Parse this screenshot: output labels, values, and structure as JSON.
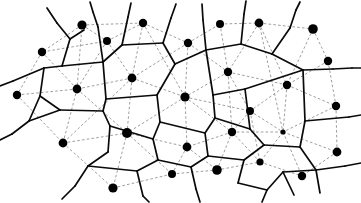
{
  "figure": {
    "width": 361,
    "height": 203,
    "background_color": "#ffffff"
  },
  "legend": {
    "site_label": "site point",
    "voronoi_label": "Voronoi edge",
    "delaunay_label": "Delaunay edge"
  },
  "style": {
    "voronoi_color": "#0a0a0a",
    "delaunay_color": "#8d8d8d",
    "site_color": "#000000",
    "voronoi_width": 1.7,
    "delaunay_width": 0.85,
    "delaunay_dash": "2.6 2.2"
  },
  "chart_data": {
    "type": "scatter",
    "xlabel": "",
    "ylabel": "",
    "xlim": [
      0,
      361
    ],
    "ylim": [
      0,
      203
    ],
    "grid": false,
    "legend_position": "none",
    "sites": [
      {
        "id": 0,
        "x": 82,
        "y": 25,
        "r": 4.6
      },
      {
        "id": 1,
        "x": 107,
        "y": 41,
        "r": 4.0
      },
      {
        "id": 2,
        "x": 143,
        "y": 23,
        "r": 4.2
      },
      {
        "id": 3,
        "x": 188,
        "y": 43,
        "r": 4.2
      },
      {
        "id": 4,
        "x": 220,
        "y": 24,
        "r": 4.0
      },
      {
        "id": 5,
        "x": 259,
        "y": 23,
        "r": 4.4
      },
      {
        "id": 6,
        "x": 313,
        "y": 29,
        "r": 4.8
      },
      {
        "id": 7,
        "x": 42,
        "y": 52,
        "r": 4.2
      },
      {
        "id": 8,
        "x": 132,
        "y": 78,
        "r": 4.4
      },
      {
        "id": 9,
        "x": 228,
        "y": 72,
        "r": 4.2
      },
      {
        "id": 10,
        "x": 328,
        "y": 61,
        "r": 4.2
      },
      {
        "id": 11,
        "x": 17,
        "y": 95,
        "r": 4.2
      },
      {
        "id": 12,
        "x": 77,
        "y": 89,
        "r": 4.4
      },
      {
        "id": 13,
        "x": 185,
        "y": 97,
        "r": 4.6
      },
      {
        "id": 14,
        "x": 287,
        "y": 85,
        "r": 4.2
      },
      {
        "id": 15,
        "x": 250,
        "y": 111,
        "r": 4.0
      },
      {
        "id": 16,
        "x": 336,
        "y": 106,
        "r": 4.2
      },
      {
        "id": 17,
        "x": 63,
        "y": 143,
        "r": 4.4
      },
      {
        "id": 18,
        "x": 127,
        "y": 133,
        "r": 5.0
      },
      {
        "id": 19,
        "x": 232,
        "y": 132,
        "r": 4.2
      },
      {
        "id": 20,
        "x": 283,
        "y": 132,
        "r": 2.6
      },
      {
        "id": 21,
        "x": 337,
        "y": 152,
        "r": 4.4
      },
      {
        "id": 22,
        "x": 187,
        "y": 147,
        "r": 4.4
      },
      {
        "id": 23,
        "x": 113,
        "y": 188,
        "r": 4.6
      },
      {
        "id": 24,
        "x": 172,
        "y": 174,
        "r": 4.0
      },
      {
        "id": 25,
        "x": 217,
        "y": 170,
        "r": 4.8
      },
      {
        "id": 26,
        "x": 260,
        "y": 162,
        "r": 3.6
      },
      {
        "id": 27,
        "x": 302,
        "y": 176,
        "r": 4.2
      }
    ],
    "voronoi_edges": [
      [
        [
          13,
          81
        ],
        [
          44,
          68
        ]
      ],
      [
        [
          44,
          68
        ],
        [
          62,
          66
        ]
      ],
      [
        [
          62,
          66
        ],
        [
          70,
          39
        ]
      ],
      [
        [
          70,
          39
        ],
        [
          57,
          23
        ]
      ],
      [
        [
          62,
          66
        ],
        [
          103,
          62
        ]
      ],
      [
        [
          103,
          62
        ],
        [
          98,
          27
        ]
      ],
      [
        [
          98,
          27
        ],
        [
          93,
          12
        ]
      ],
      [
        [
          103,
          62
        ],
        [
          122,
          45
        ]
      ],
      [
        [
          122,
          45
        ],
        [
          128,
          17
        ]
      ],
      [
        [
          122,
          45
        ],
        [
          163,
          43
        ]
      ],
      [
        [
          163,
          43
        ],
        [
          171,
          18
        ]
      ],
      [
        [
          163,
          43
        ],
        [
          175,
          64
        ]
      ],
      [
        [
          175,
          64
        ],
        [
          206,
          50
        ]
      ],
      [
        [
          206,
          50
        ],
        [
          203,
          20
        ]
      ],
      [
        [
          206,
          50
        ],
        [
          241,
          44
        ]
      ],
      [
        [
          241,
          44
        ],
        [
          244,
          14
        ]
      ],
      [
        [
          241,
          44
        ],
        [
          272,
          54
        ]
      ],
      [
        [
          272,
          54
        ],
        [
          290,
          28
        ]
      ],
      [
        [
          290,
          28
        ],
        [
          296,
          10
        ]
      ],
      [
        [
          272,
          54
        ],
        [
          303,
          70
        ]
      ],
      [
        [
          303,
          70
        ],
        [
          333,
          69
        ]
      ],
      [
        [
          333,
          69
        ],
        [
          352,
          68
        ]
      ],
      [
        [
          44,
          68
        ],
        [
          40,
          96
        ]
      ],
      [
        [
          40,
          96
        ],
        [
          29,
          121
        ]
      ],
      [
        [
          29,
          121
        ],
        [
          12,
          134
        ]
      ],
      [
        [
          40,
          96
        ],
        [
          60,
          110
        ]
      ],
      [
        [
          60,
          110
        ],
        [
          103,
          111
        ]
      ],
      [
        [
          103,
          62
        ],
        [
          106,
          99
        ]
      ],
      [
        [
          106,
          99
        ],
        [
          103,
          111
        ]
      ],
      [
        [
          103,
          111
        ],
        [
          110,
          126
        ]
      ],
      [
        [
          110,
          126
        ],
        [
          108,
          152
        ]
      ],
      [
        [
          108,
          152
        ],
        [
          88,
          166
        ]
      ],
      [
        [
          88,
          166
        ],
        [
          75,
          186
        ]
      ],
      [
        [
          88,
          166
        ],
        [
          137,
          171
        ]
      ],
      [
        [
          137,
          171
        ],
        [
          143,
          196
        ]
      ],
      [
        [
          137,
          171
        ],
        [
          158,
          160
        ]
      ],
      [
        [
          158,
          160
        ],
        [
          153,
          139
        ]
      ],
      [
        [
          153,
          139
        ],
        [
          110,
          126
        ]
      ],
      [
        [
          106,
          99
        ],
        [
          157,
          95
        ]
      ],
      [
        [
          157,
          95
        ],
        [
          175,
          64
        ]
      ],
      [
        [
          157,
          95
        ],
        [
          160,
          122
        ]
      ],
      [
        [
          160,
          122
        ],
        [
          153,
          139
        ]
      ],
      [
        [
          158,
          160
        ],
        [
          191,
          167
        ]
      ],
      [
        [
          191,
          167
        ],
        [
          196,
          189
        ]
      ],
      [
        [
          191,
          167
        ],
        [
          208,
          156
        ]
      ],
      [
        [
          208,
          156
        ],
        [
          205,
          133
        ]
      ],
      [
        [
          205,
          133
        ],
        [
          160,
          122
        ]
      ],
      [
        [
          205,
          133
        ],
        [
          215,
          118
        ]
      ],
      [
        [
          215,
          118
        ],
        [
          213,
          95
        ]
      ],
      [
        [
          213,
          95
        ],
        [
          206,
          50
        ]
      ],
      [
        [
          213,
          95
        ],
        [
          245,
          89
        ]
      ],
      [
        [
          245,
          89
        ],
        [
          303,
          70
        ]
      ],
      [
        [
          245,
          89
        ],
        [
          250,
          129
        ]
      ],
      [
        [
          250,
          129
        ],
        [
          215,
          118
        ]
      ],
      [
        [
          250,
          129
        ],
        [
          264,
          145
        ]
      ],
      [
        [
          264,
          145
        ],
        [
          244,
          160
        ]
      ],
      [
        [
          244,
          160
        ],
        [
          208,
          156
        ]
      ],
      [
        [
          244,
          160
        ],
        [
          238,
          183
        ]
      ],
      [
        [
          264,
          145
        ],
        [
          300,
          147
        ]
      ],
      [
        [
          300,
          147
        ],
        [
          305,
          121
        ]
      ],
      [
        [
          305,
          121
        ],
        [
          303,
          70
        ]
      ],
      [
        [
          305,
          121
        ],
        [
          349,
          117
        ]
      ],
      [
        [
          300,
          147
        ],
        [
          316,
          170
        ]
      ],
      [
        [
          316,
          170
        ],
        [
          320,
          193
        ]
      ],
      [
        [
          316,
          170
        ],
        [
          345,
          166
        ]
      ],
      [
        [
          238,
          183
        ],
        [
          267,
          190
        ]
      ],
      [
        [
          267,
          190
        ],
        [
          283,
          172
        ]
      ],
      [
        [
          283,
          172
        ],
        [
          316,
          170
        ]
      ],
      [
        [
          267,
          190
        ],
        [
          262,
          202
        ]
      ],
      [
        [
          283,
          172
        ],
        [
          294,
          195
        ]
      ],
      [
        [
          29,
          121
        ],
        [
          60,
          110
        ]
      ],
      [
        [
          75,
          186
        ],
        [
          62,
          199
        ]
      ],
      [
        [
          143,
          196
        ],
        [
          149,
          202
        ]
      ],
      [
        [
          196,
          189
        ],
        [
          200,
          202
        ]
      ],
      [
        [
          57,
          23
        ],
        [
          47,
          8
        ]
      ],
      [
        [
          93,
          12
        ],
        [
          90,
          2
        ]
      ],
      [
        [
          128,
          17
        ],
        [
          131,
          3
        ]
      ],
      [
        [
          171,
          18
        ],
        [
          176,
          4
        ]
      ],
      [
        [
          203,
          20
        ],
        [
          202,
          4
        ]
      ],
      [
        [
          244,
          14
        ],
        [
          246,
          1
        ]
      ],
      [
        [
          296,
          10
        ],
        [
          300,
          2
        ]
      ],
      [
        [
          352,
          68
        ],
        [
          361,
          68
        ]
      ],
      [
        [
          349,
          117
        ],
        [
          361,
          115
        ]
      ],
      [
        [
          345,
          166
        ],
        [
          361,
          163
        ]
      ],
      [
        [
          13,
          81
        ],
        [
          0,
          86
        ]
      ],
      [
        [
          12,
          134
        ],
        [
          0,
          140
        ]
      ],
      [
        [
          70,
          39
        ],
        [
          84,
          30
        ]
      ]
    ],
    "delaunay_edges": [
      [
        0,
        1
      ],
      [
        0,
        7
      ],
      [
        0,
        2
      ],
      [
        0,
        12
      ],
      [
        1,
        2
      ],
      [
        1,
        7
      ],
      [
        1,
        12
      ],
      [
        1,
        8
      ],
      [
        2,
        8
      ],
      [
        2,
        3
      ],
      [
        2,
        13
      ],
      [
        3,
        13
      ],
      [
        3,
        4
      ],
      [
        3,
        9
      ],
      [
        4,
        9
      ],
      [
        4,
        5
      ],
      [
        5,
        9
      ],
      [
        5,
        14
      ],
      [
        5,
        6
      ],
      [
        6,
        14
      ],
      [
        6,
        10
      ],
      [
        7,
        11
      ],
      [
        7,
        12
      ],
      [
        8,
        12
      ],
      [
        8,
        13
      ],
      [
        8,
        18
      ],
      [
        8,
        17
      ],
      [
        9,
        13
      ],
      [
        9,
        14
      ],
      [
        9,
        15
      ],
      [
        10,
        14
      ],
      [
        10,
        16
      ],
      [
        11,
        12
      ],
      [
        11,
        17
      ],
      [
        12,
        17
      ],
      [
        12,
        18
      ],
      [
        13,
        15
      ],
      [
        13,
        18
      ],
      [
        13,
        19
      ],
      [
        13,
        22
      ],
      [
        14,
        15
      ],
      [
        14,
        16
      ],
      [
        14,
        20
      ],
      [
        15,
        19
      ],
      [
        15,
        20
      ],
      [
        16,
        20
      ],
      [
        16,
        21
      ],
      [
        17,
        18
      ],
      [
        17,
        23
      ],
      [
        18,
        22
      ],
      [
        18,
        23
      ],
      [
        18,
        24
      ],
      [
        19,
        20
      ],
      [
        19,
        22
      ],
      [
        19,
        25
      ],
      [
        19,
        26
      ],
      [
        20,
        21
      ],
      [
        20,
        26
      ],
      [
        20,
        27
      ],
      [
        21,
        27
      ],
      [
        22,
        24
      ],
      [
        22,
        25
      ],
      [
        23,
        24
      ],
      [
        24,
        25
      ],
      [
        25,
        26
      ],
      [
        26,
        27
      ],
      [
        3,
        8
      ],
      [
        9,
        19
      ],
      [
        15,
        26
      ],
      [
        5,
        20
      ]
    ],
    "delaunay_hull_rays": [],
    "counts": {
      "site_count": 28,
      "voronoi_edge_count": 86,
      "delaunay_edge_count": 70
    }
  }
}
